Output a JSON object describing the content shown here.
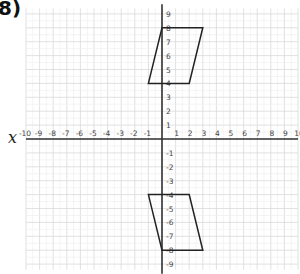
{
  "question": {
    "label": "8)"
  },
  "axes": {
    "x_axis_label": "x",
    "x_range": [
      -10,
      10
    ],
    "y_range": [
      -9,
      9
    ],
    "x_ticks": [
      -10,
      -9,
      -8,
      -7,
      -6,
      -5,
      -4,
      -3,
      -2,
      -1,
      1,
      2,
      3,
      4,
      5,
      6,
      7,
      8,
      9,
      10
    ],
    "y_ticks": [
      9,
      8,
      7,
      6,
      5,
      4,
      3,
      2,
      1,
      -1,
      -2,
      -3,
      -4,
      -5,
      -6,
      -7,
      -8,
      -9
    ]
  },
  "shapes": [
    {
      "name": "original-parallelogram",
      "vertices": [
        [
          -1,
          4
        ],
        [
          0,
          8
        ],
        [
          3,
          8
        ],
        [
          2,
          4
        ]
      ]
    },
    {
      "name": "reflected-parallelogram",
      "vertices": [
        [
          -1,
          -4
        ],
        [
          2,
          -4
        ],
        [
          3,
          -8
        ],
        [
          0,
          -8
        ]
      ]
    }
  ],
  "colors": {
    "grid": "#d9d9d9",
    "axis": "#333333",
    "shape": "#222222",
    "tick_text": "#444444"
  }
}
